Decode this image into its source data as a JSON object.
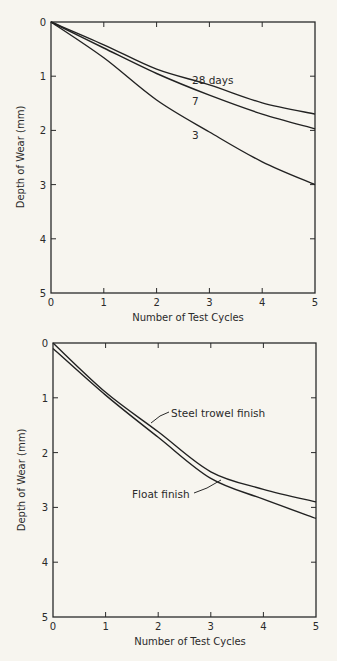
{
  "chart_data": [
    {
      "type": "line",
      "title": "",
      "xlabel": "Number of Test Cycles",
      "ylabel": "Depth of Wear (mm)",
      "xlim": [
        0,
        5
      ],
      "ylim": [
        0,
        5
      ],
      "y_inverted": true,
      "grid": false,
      "x_ticks": [
        "0",
        "1",
        "2",
        "3",
        "4",
        "5"
      ],
      "y_ticks": [
        "0",
        "1",
        "2",
        "3",
        "4",
        "5"
      ],
      "x": [
        0,
        1,
        2,
        3,
        4,
        5
      ],
      "series": [
        {
          "name": "28 days",
          "label": "28 days",
          "values": [
            0,
            0.42,
            0.87,
            1.16,
            1.49,
            1.7
          ]
        },
        {
          "name": "7 days",
          "label": "7",
          "values": [
            0,
            0.48,
            0.95,
            1.35,
            1.7,
            1.97
          ]
        },
        {
          "name": "3 days",
          "label": "3",
          "values": [
            0,
            0.66,
            1.44,
            2.03,
            2.58,
            3.0
          ]
        }
      ]
    },
    {
      "type": "line",
      "title": "",
      "xlabel": "Number of Test Cycles",
      "ylabel": "Depth of Wear (mm)",
      "xlim": [
        0,
        5
      ],
      "ylim": [
        0,
        5
      ],
      "y_inverted": true,
      "grid": false,
      "x_ticks": [
        "0",
        "1",
        "2",
        "3",
        "4",
        "5"
      ],
      "y_ticks": [
        "0",
        "1",
        "2",
        "3",
        "4",
        "5"
      ],
      "x": [
        0,
        1,
        2,
        3,
        4,
        5
      ],
      "series": [
        {
          "name": "Steel trowel finish",
          "label": "Steel trowel finish",
          "values": [
            0,
            0.9,
            1.62,
            2.35,
            2.67,
            2.9
          ]
        },
        {
          "name": "Float finish",
          "label": "Float finish",
          "values": [
            0.1,
            0.95,
            1.72,
            2.47,
            2.85,
            3.2
          ]
        }
      ]
    }
  ],
  "colors": {
    "background": "#f7f5ef",
    "ink": "#222222"
  }
}
